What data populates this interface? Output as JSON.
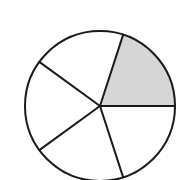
{
  "diagram": {
    "type": "fraction-circle",
    "center": [
      100,
      106
    ],
    "radius": 75,
    "sectors": 5,
    "shaded_sectors": [
      0
    ],
    "start_angle_deg": 0,
    "colors": {
      "stroke": "#1a1a1a",
      "shade": "#d6d6d6",
      "background": "#ffffff"
    }
  }
}
